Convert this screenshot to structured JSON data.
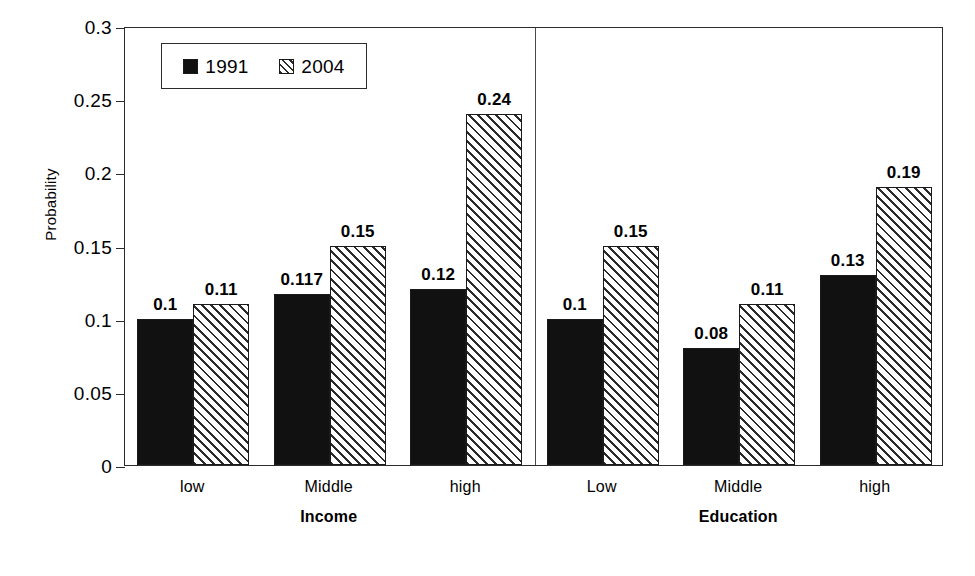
{
  "chart_data": {
    "type": "bar",
    "title": "",
    "subtitle": "",
    "xlabel": "",
    "ylabel": "Probability",
    "ylim": [
      0,
      0.3
    ],
    "yticks": [
      "0",
      "0.05",
      "0.1",
      "0.15",
      "0.2",
      "0.25",
      "0.3"
    ],
    "ytick_values": [
      0,
      0.05,
      0.1,
      0.15,
      0.2,
      0.25,
      0.3
    ],
    "grid": false,
    "legend_position": "top-left inside plot area",
    "legend": [
      "1991",
      "2004"
    ],
    "panels": [
      {
        "name": "Income",
        "categories": [
          "low",
          "Middle",
          "high"
        ],
        "series": [
          {
            "name": "1991",
            "values": [
              0.1,
              0.117,
              0.12
            ],
            "labels": [
              "0.1",
              "0.117",
              "0.12"
            ]
          },
          {
            "name": "2004",
            "values": [
              0.11,
              0.15,
              0.24
            ],
            "labels": [
              "0.11",
              "0.15",
              "0.24"
            ]
          }
        ]
      },
      {
        "name": "Education",
        "categories": [
          "Low",
          "Middle",
          "high"
        ],
        "series": [
          {
            "name": "1991",
            "values": [
              0.1,
              0.08,
              0.13
            ],
            "labels": [
              "0.1",
              "0.08",
              "0.13"
            ]
          },
          {
            "name": "2004",
            "values": [
              0.15,
              0.11,
              0.19
            ],
            "labels": [
              "0.15",
              "0.11",
              "0.19"
            ]
          }
        ]
      }
    ],
    "colors": {
      "series_1991": "#111111",
      "series_2004_hatch": "#2b2b2b",
      "series_2004_background": "#ffffff",
      "axis": "#2b2b2b",
      "text": "#000000",
      "plot_background": "#ffffff"
    }
  },
  "axis": {
    "y_title": "Probability",
    "y_tick_labels": [
      "0.3",
      "0.25",
      "0.2",
      "0.15",
      "0.1",
      "0.05",
      "0"
    ]
  },
  "legend": {
    "entries": [
      {
        "label": "1991",
        "swatch": "solid-black-square"
      },
      {
        "label": "2004",
        "swatch": "hatched-square"
      }
    ]
  }
}
